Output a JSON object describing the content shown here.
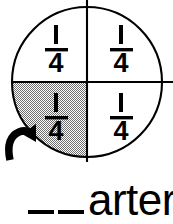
{
  "worksheet": {
    "type": "fraction-circle-exercise",
    "figure": {
      "shape": "circle",
      "parts_total": 4,
      "parts_shaded": 1,
      "divider_lines": [
        "vertical",
        "horizontal"
      ],
      "quadrants": [
        {
          "position": "top-left",
          "label_numerator": "1",
          "label_denominator": "4",
          "shaded": false
        },
        {
          "position": "top-right",
          "label_numerator": "1",
          "label_denominator": "4",
          "shaded": false
        },
        {
          "position": "bottom-left",
          "label_numerator": "1",
          "label_denominator": "4",
          "shaded": true
        },
        {
          "position": "bottom-right",
          "label_numerator": "1",
          "label_denominator": "4",
          "shaded": false
        }
      ],
      "pointer": {
        "icon": "curved-arrow-icon",
        "points_to": "bottom-left",
        "direction": "up-right"
      }
    },
    "answer_prompt": {
      "blanks": "__",
      "word_ending": "arter",
      "full_text": "__arter"
    }
  },
  "colors": {
    "ink": "#000000",
    "paper": "#ffffff",
    "shade_pattern": "#9a9a9a"
  }
}
